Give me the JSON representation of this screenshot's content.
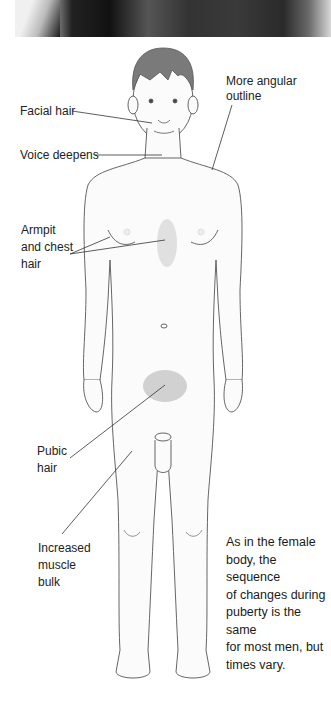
{
  "labels": {
    "facial_hair": "Facial hair",
    "voice": "Voice deepens",
    "angular": "More angular\noutline",
    "armpit": "Armpit\nand chest\nhair",
    "pubic": "Pubic\nhair",
    "muscle": "Increased\nmuscle\nbulk"
  },
  "caption": "As in the female\nbody, the sequence\nof changes during\npuberty is the same\nfor most men, but\ntimes vary.",
  "colors": {
    "hair": "#7a7a7a",
    "skin_outline": "#555555",
    "body_hair": "#9a9a9a",
    "text": "#222222"
  }
}
